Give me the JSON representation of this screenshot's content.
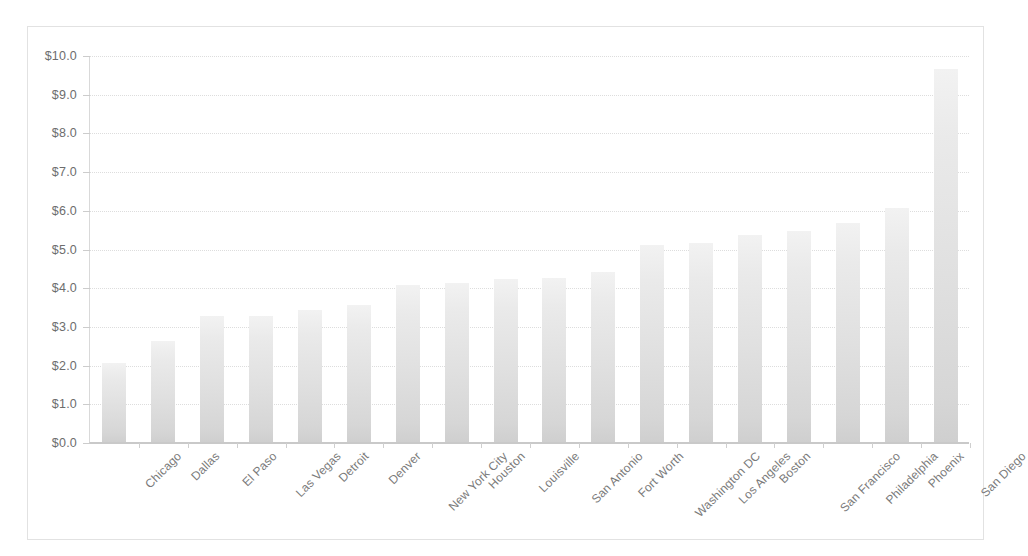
{
  "chart_data": {
    "type": "bar",
    "title": "",
    "subtitle": "",
    "xlabel": "",
    "ylabel": "",
    "ylim": [
      0.0,
      10.0
    ],
    "ytick_step": 1.0,
    "ytick_labels": [
      "$10.0",
      "$9.0",
      "$8.0",
      "$7.0",
      "$6.0",
      "$5.0",
      "$4.0",
      "$3.0",
      "$2.0",
      "$1.0",
      "$0.0"
    ],
    "ytick_values": [
      10.0,
      9.0,
      8.0,
      7.0,
      6.0,
      5.0,
      4.0,
      3.0,
      2.0,
      1.0,
      0.0
    ],
    "grid": true,
    "grid_axis": "y",
    "legend": false,
    "legend_position": "none",
    "bar_color": "#e3e3e3",
    "bar_edge_color": "#cfcfcf",
    "grid_color": "#dddddd",
    "axis_color": "#c9c9c9",
    "text_color": "#6d6d6d",
    "background_color": "#ffffff",
    "categories": [
      "Chicago",
      "Dallas",
      "El Paso",
      "Las Vegas",
      "Detroit",
      "Denver",
      "New York City",
      "Houston",
      "Louisville",
      "San Antonio",
      "Fort Worth",
      "Washington DC",
      "Los Angeles",
      "Boston",
      "San Francisco",
      "Philadelphia",
      "Phoenix",
      "San Diego"
    ],
    "values": [
      2.05,
      2.6,
      3.25,
      3.25,
      3.4,
      3.55,
      4.05,
      4.1,
      4.2,
      4.25,
      4.4,
      5.1,
      5.15,
      5.35,
      5.45,
      5.65,
      6.05,
      9.65
    ],
    "value_labels": [
      "$2.05",
      "$2.60",
      "$3.25",
      "$3.25",
      "$3.40",
      "$3.55",
      "$4.05",
      "$4.10",
      "$4.20",
      "$4.25",
      "$4.40",
      "$5.10",
      "$5.15",
      "$5.35",
      "$5.45",
      "$5.65",
      "$6.05",
      "$9.65"
    ]
  }
}
